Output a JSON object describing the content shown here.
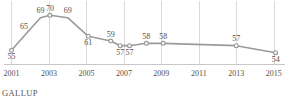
{
  "attribution": {
    "label": "GALLUP"
  },
  "axis": {
    "tick_labels": [
      "2001",
      "2003",
      "2005",
      "2007",
      "2009",
      "2011",
      "2013",
      "2015"
    ],
    "tick_years": [
      2001,
      2003,
      2005,
      2007,
      2009,
      2011,
      2013,
      2015
    ]
  },
  "colors": {
    "line": "#9a9a9a",
    "marker_fill": "#ffffff",
    "gridline": "#dadada",
    "axis": "#c8c8c8",
    "text": "#55504c",
    "background": "#ffffff"
  },
  "chart_data": {
    "type": "line",
    "title": "",
    "subtitle": "",
    "xlabel": "",
    "ylabel": "",
    "xlim": [
      2000.6,
      2015.6
    ],
    "ylim": [
      50,
      74
    ],
    "grid": true,
    "grid_axis": "x",
    "legend": false,
    "legend_position": "none",
    "x_tick_labels": [
      "2001",
      "2003",
      "2005",
      "2007",
      "2009",
      "2011",
      "2013",
      "2015"
    ],
    "series": [
      {
        "name": "",
        "points": [
          {
            "x": 2001.0,
            "y": 55,
            "label": "55",
            "label_pos": "below",
            "marker": true
          },
          {
            "x": 2002.1,
            "y": 65,
            "label": "65",
            "label_pos": "left",
            "marker": false
          },
          {
            "x": 2002.55,
            "y": 69,
            "label": "69",
            "label_pos": "above",
            "marker": false
          },
          {
            "x": 2003.05,
            "y": 70,
            "label": "70",
            "label_pos": "above",
            "marker": true
          },
          {
            "x": 2004.0,
            "y": 69,
            "label": "69",
            "label_pos": "above",
            "marker": false
          },
          {
            "x": 2005.1,
            "y": 61,
            "label": "61",
            "label_pos": "below",
            "marker": true
          },
          {
            "x": 2006.3,
            "y": 59,
            "label": "59",
            "label_pos": "above",
            "marker": true
          },
          {
            "x": 2006.8,
            "y": 57,
            "label": "57",
            "label_pos": "below",
            "marker": true
          },
          {
            "x": 2007.3,
            "y": 57,
            "label": "57",
            "label_pos": "below",
            "marker": true
          },
          {
            "x": 2008.2,
            "y": 58,
            "label": "58",
            "label_pos": "above",
            "marker": true
          },
          {
            "x": 2009.1,
            "y": 58,
            "label": "58",
            "label_pos": "above",
            "marker": true
          },
          {
            "x": 2013.0,
            "y": 57,
            "label": "57",
            "label_pos": "above",
            "marker": true
          },
          {
            "x": 2015.1,
            "y": 54,
            "label": "54",
            "label_pos": "below",
            "marker": true
          }
        ]
      }
    ],
    "values": [
      55,
      65,
      69,
      70,
      69,
      61,
      59,
      57,
      57,
      58,
      58,
      57,
      54
    ],
    "value_labels": [
      "55",
      "65",
      "69",
      "70",
      "69",
      "61",
      "59",
      "57",
      "57",
      "58",
      "58",
      "57",
      "54"
    ]
  }
}
